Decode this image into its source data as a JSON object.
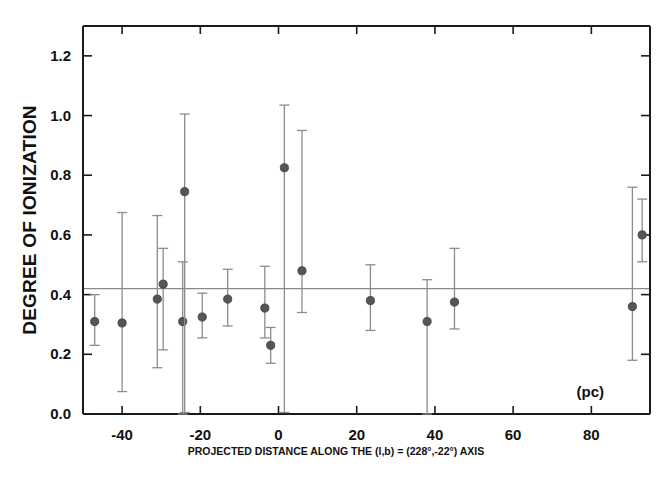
{
  "figure": {
    "background_color": "#ffffff",
    "axis_color": "#1a1a1a",
    "marker_color": "#555555",
    "errorbar_color": "#8c8c8c",
    "refline_color": "#8a8a8a",
    "unit_annotation": "(pc)"
  },
  "chart_data": {
    "type": "scatter",
    "title": "",
    "subtitle": "",
    "xlabel": "PROJECTED DISTANCE ALONG THE (l,b) = (228°,-22°) AXIS",
    "ylabel": "DEGREE OF IONIZATION",
    "xunit": "(pc)",
    "xlim": [
      -50,
      95
    ],
    "ylim": [
      0.0,
      1.3
    ],
    "xticks": [
      -40,
      -20,
      0,
      20,
      40,
      60,
      80
    ],
    "xticklabels": [
      "-40",
      "-20",
      "0",
      "20",
      "40",
      "60",
      "80"
    ],
    "yticks": [
      0.0,
      0.2,
      0.4,
      0.6,
      0.8,
      1.0,
      1.2
    ],
    "yticklabels": [
      "0.0",
      "0.2",
      "0.4",
      "0.6",
      "0.8",
      "1.0",
      "1.2"
    ],
    "grid": false,
    "legend": false,
    "reference_line": {
      "orientation": "horizontal",
      "y": 0.42,
      "label": "mean degree of ionization"
    },
    "errorbars": true,
    "points": [
      {
        "x": -47.0,
        "y": 0.31,
        "yerr_lo": 0.08,
        "yerr_hi": 0.09
      },
      {
        "x": -40.0,
        "y": 0.305,
        "yerr_lo": 0.23,
        "yerr_hi": 0.37
      },
      {
        "x": -31.0,
        "y": 0.385,
        "yerr_lo": 0.23,
        "yerr_hi": 0.28
      },
      {
        "x": -29.5,
        "y": 0.435,
        "yerr_lo": 0.22,
        "yerr_hi": 0.12
      },
      {
        "x": -24.5,
        "y": 0.31,
        "yerr_lo": 0.31,
        "yerr_hi": 0.2
      },
      {
        "x": -24.0,
        "y": 0.745,
        "yerr_lo": 0.74,
        "yerr_hi": 0.26
      },
      {
        "x": -19.5,
        "y": 0.325,
        "yerr_lo": 0.07,
        "yerr_hi": 0.08
      },
      {
        "x": -13.0,
        "y": 0.385,
        "yerr_lo": 0.09,
        "yerr_hi": 0.1
      },
      {
        "x": -3.5,
        "y": 0.355,
        "yerr_lo": 0.1,
        "yerr_hi": 0.14
      },
      {
        "x": -2.0,
        "y": 0.23,
        "yerr_lo": 0.06,
        "yerr_hi": 0.06
      },
      {
        "x": 1.5,
        "y": 0.825,
        "yerr_lo": 0.82,
        "yerr_hi": 0.21
      },
      {
        "x": 6.0,
        "y": 0.48,
        "yerr_lo": 0.14,
        "yerr_hi": 0.47
      },
      {
        "x": 23.5,
        "y": 0.38,
        "yerr_lo": 0.1,
        "yerr_hi": 0.12
      },
      {
        "x": 38.0,
        "y": 0.31,
        "yerr_lo": 0.31,
        "yerr_hi": 0.14
      },
      {
        "x": 45.0,
        "y": 0.375,
        "yerr_lo": 0.09,
        "yerr_hi": 0.18
      },
      {
        "x": 90.5,
        "y": 0.36,
        "yerr_lo": 0.18,
        "yerr_hi": 0.4
      },
      {
        "x": 93.0,
        "y": 0.6,
        "yerr_lo": 0.09,
        "yerr_hi": 0.12
      }
    ]
  }
}
